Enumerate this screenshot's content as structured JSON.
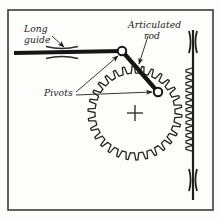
{
  "figure": {
    "background_color": "#fdfdfb",
    "ink_color": "#1f1f1f",
    "border": {
      "name": "figure-border",
      "x": 8,
      "y": 10,
      "width": 205,
      "height": 200,
      "stroke_width": 1.6
    },
    "labels": [
      {
        "id": "long-guide",
        "line1": "Long",
        "line2": "guide",
        "x": 24,
        "y": 32
      },
      {
        "id": "articulated-rod",
        "line1": "Articulated",
        "line2": "rod",
        "x": 128,
        "y": 28
      },
      {
        "id": "pivots",
        "line1": "Pivots",
        "line2": "",
        "x": 44,
        "y": 96
      }
    ],
    "components": {
      "long_guide_bar": {
        "name": "long-guide-bar",
        "x1": 14,
        "y1": 53,
        "x2": 122,
        "y2": 51,
        "stroke_width": 4.2
      },
      "guide_bushing": {
        "name": "guide-bushing",
        "center_x": 62,
        "center_y": 52,
        "half_width": 16
      },
      "articulated_rod": {
        "name": "articulated-rod-link",
        "x1": 122,
        "y1": 51,
        "x2": 158,
        "y2": 92,
        "stroke_width": 4.2
      },
      "pivot_upper": {
        "name": "pivot-upper",
        "cx": 122,
        "cy": 51,
        "r": 4.2
      },
      "pivot_lower": {
        "name": "pivot-lower",
        "cx": 158,
        "cy": 92,
        "r": 4.2
      },
      "gear": {
        "name": "pinion-gear",
        "cx": 135,
        "cy": 113,
        "outer_radius": 47,
        "root_radius": 40,
        "teeth": 30
      },
      "gear_center_mark": {
        "name": "gear-center-crosshair",
        "cx": 135,
        "cy": 113,
        "arm": 8
      },
      "rack": {
        "name": "vertical-rack",
        "x": 193,
        "y_top": 30,
        "y_bottom": 200,
        "stroke_width": 2.2,
        "tooth_top": 68,
        "tooth_bottom": 152,
        "tooth_count": 13,
        "tooth_depth": 6
      },
      "rack_guide_top": {
        "name": "rack-guide-top",
        "cx": 193,
        "cy": 42,
        "half_height": 11
      },
      "rack_guide_bottom": {
        "name": "rack-guide-bottom",
        "cx": 193,
        "cy": 180,
        "half_height": 11
      }
    },
    "leaders": [
      {
        "id": "leader-long-guide",
        "name": "leader-long-guide",
        "x1": 52,
        "y1": 36,
        "x2": 64,
        "y2": 47
      },
      {
        "id": "leader-articulated-rod",
        "name": "leader-articulated-rod",
        "x1": 148,
        "y1": 36,
        "x2": 139,
        "y2": 64
      },
      {
        "id": "leader-pivot-upper",
        "name": "leader-pivot-upper",
        "x1": 76,
        "y1": 92,
        "x2": 118,
        "y2": 56
      },
      {
        "id": "leader-pivot-lower",
        "name": "leader-pivot-lower",
        "x1": 76,
        "y1": 95,
        "x2": 152,
        "y2": 92
      }
    ]
  }
}
